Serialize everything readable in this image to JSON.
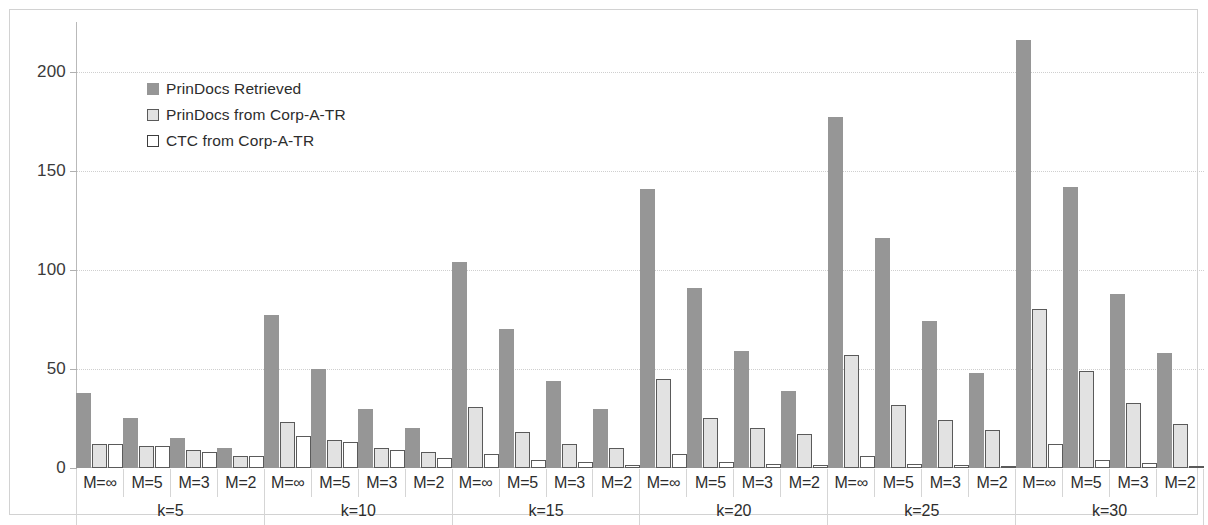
{
  "chart_data": {
    "type": "bar",
    "title": "",
    "subtitle": "",
    "xlabel": "",
    "ylabel": "",
    "ylim": [
      0,
      225
    ],
    "yticks": [
      0,
      50,
      100,
      150,
      200
    ],
    "ytick_labels": [
      "0",
      "50",
      "100",
      "150",
      "200"
    ],
    "grid": true,
    "legend_position": "inside-top-left",
    "group_labels": [
      "k=5",
      "k=10",
      "k=15",
      "k=20",
      "k=25",
      "k=30"
    ],
    "categories": [
      "M=∞",
      "M=5",
      "M=3",
      "M=2",
      "M=∞",
      "M=5",
      "M=3",
      "M=2",
      "M=∞",
      "M=5",
      "M=3",
      "M=2",
      "M=∞",
      "M=5",
      "M=3",
      "M=2",
      "M=∞",
      "M=5",
      "M=3",
      "M=2",
      "M=∞",
      "M=5",
      "M=3",
      "M=2"
    ],
    "series": [
      {
        "name": "PrinDocs Retrieved",
        "color": "#969696",
        "values": [
          38,
          25,
          15,
          10,
          77,
          50,
          30,
          20,
          104,
          70,
          44,
          30,
          141,
          91,
          59,
          39,
          177,
          116,
          74,
          48,
          216,
          142,
          88,
          58
        ]
      },
      {
        "name": "PrinDocs from Corp-A-TR",
        "color": "#e2e2e2",
        "values": [
          12,
          11,
          9,
          6,
          23,
          14,
          10,
          8,
          31,
          18,
          12,
          10,
          45,
          25,
          20,
          17,
          57,
          32,
          24,
          19,
          80,
          49,
          33,
          22
        ]
      },
      {
        "name": "CTC from Corp-A-TR",
        "color": "#ffffff",
        "values": [
          12,
          11,
          8,
          6,
          16,
          13,
          9,
          5,
          7,
          4,
          3,
          1.5,
          7,
          3,
          2,
          1.5,
          6,
          2,
          1.5,
          1,
          12,
          4,
          2.5,
          1
        ]
      }
    ]
  },
  "legend": {
    "items": [
      {
        "label": "PrinDocs Retrieved"
      },
      {
        "label": "PrinDocs from Corp-A-TR"
      },
      {
        "label": "CTC from Corp-A-TR"
      }
    ]
  }
}
